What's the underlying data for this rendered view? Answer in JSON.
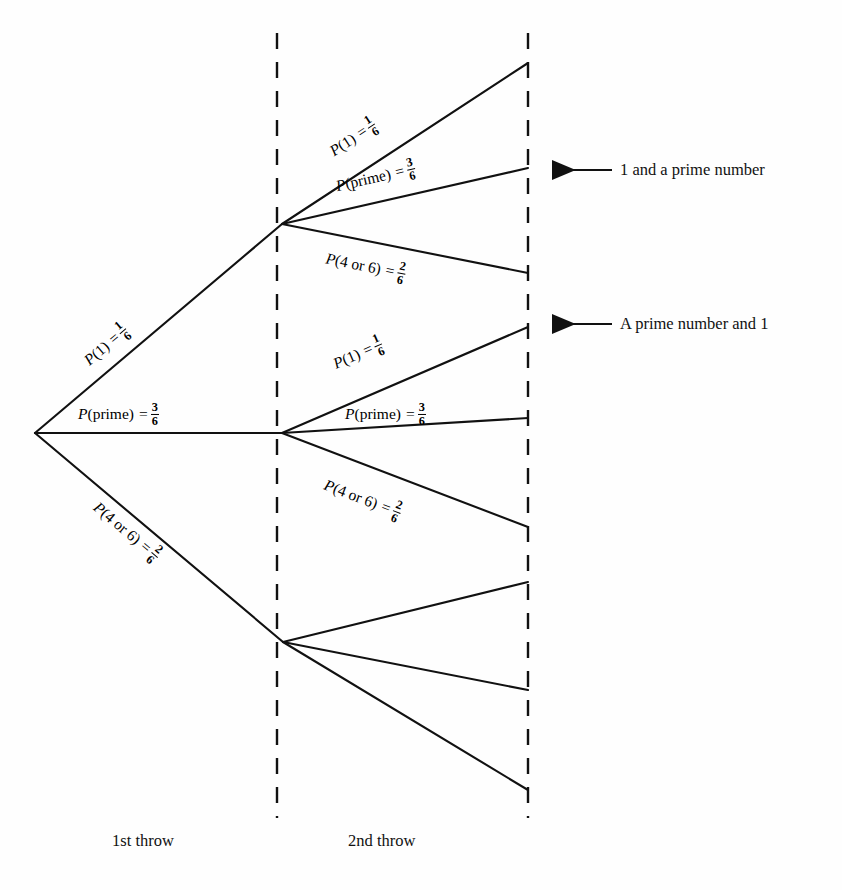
{
  "figure": {
    "kind": "probability-tree-diagram",
    "background_color": "#fefefe",
    "ink_color": "#111111",
    "width": 842,
    "height": 890
  },
  "stage_labels": [
    {
      "id": "throw-1",
      "text": "1st throw",
      "x": 112,
      "y": 831
    },
    {
      "id": "throw-2",
      "text": "2nd throw",
      "x": 348,
      "y": 831
    }
  ],
  "outcome_callouts": [
    {
      "id": "one-and-prime",
      "text": "1 and a prime number",
      "arrow_tip_x": 552,
      "arrow_tail_x": 612,
      "arrow_y": 170,
      "text_x": 620,
      "text_y": 170
    },
    {
      "id": "prime-and-one",
      "text": "A prime number and 1",
      "arrow_tip_x": 552,
      "arrow_tail_x": 612,
      "arrow_y": 324,
      "text_x": 620,
      "text_y": 324
    }
  ],
  "nodes": {
    "root": {
      "x": 35,
      "y": 433
    },
    "level1": [
      {
        "id": "n-one",
        "x": 282,
        "y": 224
      },
      {
        "id": "n-prime",
        "x": 282,
        "y": 433
      },
      {
        "id": "n-four-or-six",
        "x": 283,
        "y": 642
      }
    ]
  },
  "dividers": [
    {
      "id": "divider-after-throw-1",
      "x": 277,
      "y1": 33,
      "y2": 818
    },
    {
      "id": "divider-after-throw-2",
      "x": 528,
      "y1": 33,
      "y2": 818
    }
  ],
  "branches": {
    "level1": [
      {
        "id": "b1-one",
        "event": "1",
        "label_p": "P",
        "label_event": "(1)",
        "numerator": "1",
        "denominator": "6",
        "from": [
          35,
          433
        ],
        "to": [
          282,
          224
        ],
        "label_x": 86,
        "label_y": 362,
        "label_rot": -40.3,
        "labelled": true
      },
      {
        "id": "b1-prime",
        "event": "prime",
        "label_p": "P",
        "label_event": "(prime)",
        "numerator": "3",
        "denominator": "6",
        "from": [
          35,
          433
        ],
        "to": [
          282,
          433
        ],
        "label_x": 78,
        "label_y": 414,
        "label_rot": 0,
        "labelled": true
      },
      {
        "id": "b1-four-or-six",
        "event": "4 or 6",
        "label_p": "P",
        "label_event": "(4 or 6)",
        "numerator": "2",
        "denominator": "6",
        "from": [
          35,
          433
        ],
        "to": [
          283,
          642
        ],
        "label_x": 96,
        "label_y": 505,
        "label_rot": 40.1,
        "labelled": true
      }
    ],
    "level2": [
      {
        "id": "b2-one-one",
        "event": "1",
        "label_p": "P",
        "label_event": "(1)",
        "numerator": "1",
        "denominator": "6",
        "from": [
          282,
          224
        ],
        "to": [
          528,
          63
        ],
        "label_x": 331,
        "label_y": 152,
        "label_rot": -33.2,
        "labelled": true
      },
      {
        "id": "b2-one-prime",
        "event": "prime",
        "label_p": "P",
        "label_event": "(prime)",
        "numerator": "3",
        "denominator": "6",
        "from": [
          282,
          224
        ],
        "to": [
          528,
          168
        ],
        "label_x": 336,
        "label_y": 186,
        "label_rot": -12.8,
        "labelled": true
      },
      {
        "id": "b2-one-foursix",
        "event": "4 or 6",
        "label_p": "P",
        "label_event": "(4 or 6)",
        "numerator": "2",
        "denominator": "6",
        "from": [
          282,
          224
        ],
        "to": [
          528,
          273
        ],
        "label_x": 326,
        "label_y": 258,
        "label_rot": 11.3,
        "labelled": true
      },
      {
        "id": "b2-prime-one",
        "event": "1",
        "label_p": "P",
        "label_event": "(1)",
        "numerator": "1",
        "denominator": "6",
        "from": [
          282,
          433
        ],
        "to": [
          528,
          327
        ],
        "label_x": 334,
        "label_y": 364,
        "label_rot": -23.3,
        "labelled": true
      },
      {
        "id": "b2-prime-prime",
        "event": "prime",
        "label_p": "P",
        "label_event": "(prime)",
        "numerator": "3",
        "denominator": "6",
        "from": [
          282,
          433
        ],
        "to": [
          528,
          418
        ],
        "label_x": 345,
        "label_y": 414,
        "label_rot": 0,
        "labelled": true
      },
      {
        "id": "b2-prime-foursix",
        "event": "4 or 6",
        "label_p": "P",
        "label_event": "(4 or 6)",
        "numerator": "2",
        "denominator": "6",
        "from": [
          282,
          433
        ],
        "to": [
          528,
          527
        ],
        "label_x": 325,
        "label_y": 484,
        "label_rot": 21.0,
        "labelled": true
      },
      {
        "id": "b2-foursix-one",
        "event": "1",
        "from": [
          283,
          642
        ],
        "to": [
          528,
          582
        ],
        "labelled": false
      },
      {
        "id": "b2-foursix-prime",
        "event": "prime",
        "from": [
          283,
          642
        ],
        "to": [
          528,
          690
        ],
        "labelled": false
      },
      {
        "id": "b2-foursix-foursix",
        "event": "4 or 6",
        "from": [
          283,
          642
        ],
        "to": [
          528,
          790
        ],
        "labelled": false
      }
    ]
  }
}
